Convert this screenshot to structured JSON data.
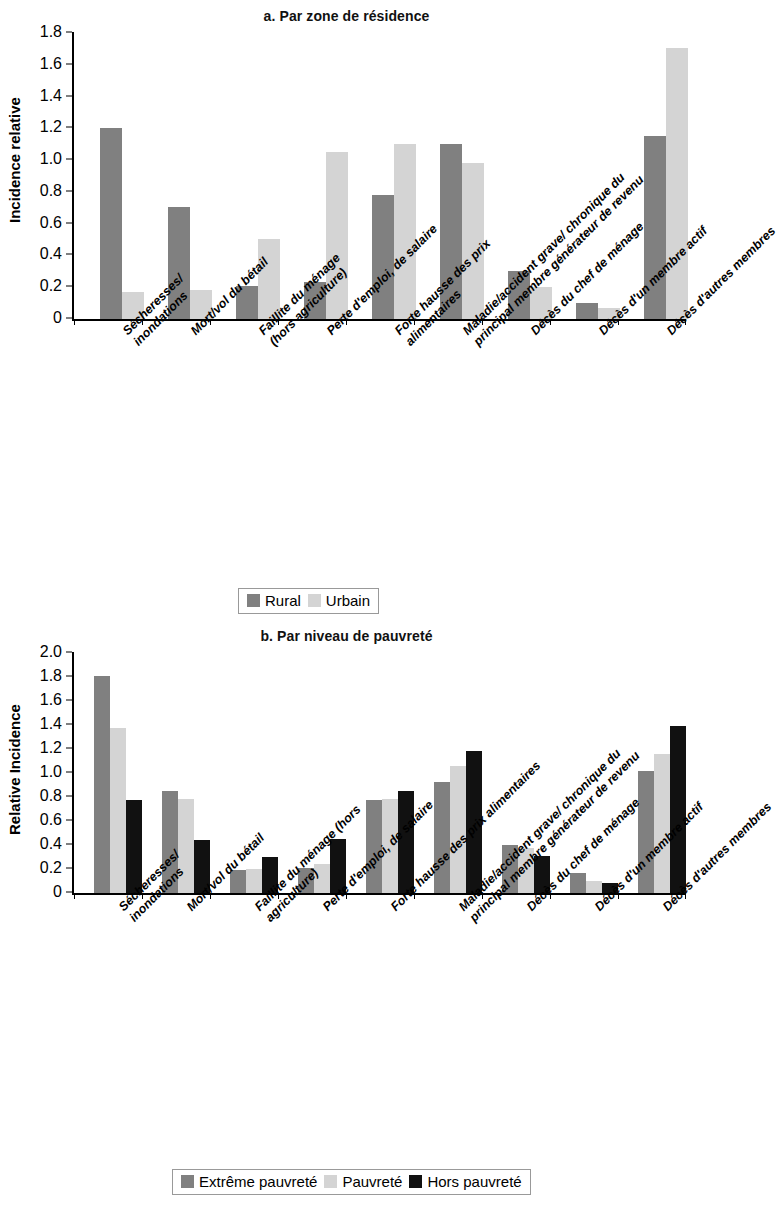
{
  "figure": {
    "panels": [
      {
        "title": "a. Par zone de résidence",
        "ylabel": "Incidence relative",
        "legend_position": "bottom-center"
      },
      {
        "title": "b. Par niveau de pauvreté",
        "ylabel": "Relative Incidence",
        "legend_position": "bottom-center"
      }
    ]
  },
  "chart_data": [
    {
      "type": "bar",
      "title": "a. Par zone de résidence",
      "xlabel": "",
      "ylabel": "Incidence relative",
      "ylim": [
        0,
        1.8
      ],
      "yticks": [
        "0",
        "0.2",
        "0.4",
        "0.6",
        "0.8",
        "1.0",
        "1.2",
        "1.4",
        "1.6",
        "1.8"
      ],
      "ytick_values": [
        0,
        0.2,
        0.4,
        0.6,
        0.8,
        1.0,
        1.2,
        1.4,
        1.6,
        1.8
      ],
      "grid": false,
      "legend": [
        "Rural",
        "Urbain"
      ],
      "legend_position": "bottom-center",
      "categories": [
        "Sécheresses/\ninondations",
        "Mort/vol du bétail",
        "Faillite du ménage\n(hors agriculture)",
        "Perte d'emploi, de salaire",
        "Forte hausse des prix\nalimentaires",
        "Maladie/accident grave/ chronique du\nprincipal membre générateur de revenu",
        "Décès du chef de ménage",
        "Décès d'un membre actif",
        "Décès d'autres membres"
      ],
      "series": [
        {
          "name": "Rural",
          "color": "#808080",
          "values": [
            1.2,
            0.7,
            0.21,
            0.23,
            0.78,
            1.1,
            0.3,
            0.1,
            1.15
          ]
        },
        {
          "name": "Urbain",
          "color": "#d4d4d4",
          "values": [
            0.17,
            0.18,
            0.5,
            1.05,
            1.1,
            0.98,
            0.2,
            0.07,
            1.7
          ]
        }
      ]
    },
    {
      "type": "bar",
      "title": "b. Par niveau de pauvreté",
      "xlabel": "",
      "ylabel": "Relative Incidence",
      "ylim": [
        0,
        2.0
      ],
      "yticks": [
        "0",
        "0.2",
        "0.4",
        "0.6",
        "0.8",
        "1.0",
        "1.2",
        "1.4",
        "1.6",
        "1.8",
        "2.0"
      ],
      "ytick_values": [
        0,
        0.2,
        0.4,
        0.6,
        0.8,
        1.0,
        1.2,
        1.4,
        1.6,
        1.8,
        2.0
      ],
      "grid": false,
      "legend": [
        "Extrême pauvreté",
        "Pauvreté",
        "Hors pauvreté"
      ],
      "legend_position": "bottom-center",
      "categories": [
        "Sécheresses/\ninondations",
        "Mort/vol du bétail",
        "Faillite du ménage (hors\nagriculture)",
        "Perte d'emploi, de salaire",
        "Forte hausse des prix alimentaires",
        "Maladie/accident grave/ chronique du\nprincipal membre générateur de revenu",
        "Décès du chef de ménage",
        "Décès d'un membre actif",
        "Décès d'autres membres"
      ],
      "series": [
        {
          "name": "Extrême pauvreté",
          "color": "#808080",
          "values": [
            1.8,
            0.85,
            0.19,
            0.21,
            0.77,
            0.92,
            0.4,
            0.17,
            1.01
          ]
        },
        {
          "name": "Pauvreté",
          "color": "#d4d4d4",
          "values": [
            1.37,
            0.78,
            0.2,
            0.24,
            0.78,
            1.05,
            0.37,
            0.1,
            1.15
          ]
        },
        {
          "name": "Hors pauvreté",
          "color": "#111111",
          "values": [
            0.77,
            0.44,
            0.3,
            0.45,
            0.85,
            1.18,
            0.31,
            0.08,
            1.39
          ]
        }
      ]
    }
  ]
}
